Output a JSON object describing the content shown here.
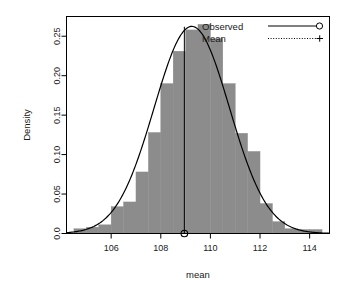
{
  "chart_data": {
    "type": "histogram",
    "title": "",
    "xlabel": "mean",
    "ylabel": "Density",
    "xlim": [
      104.2,
      114.8
    ],
    "ylim": [
      0.0,
      0.275
    ],
    "xticks": [
      106,
      108,
      110,
      112,
      114
    ],
    "xtick_labels": [
      "106",
      "108",
      "110",
      "112",
      "114"
    ],
    "yticks": [
      0.0,
      0.05,
      0.1,
      0.15,
      0.2,
      0.25
    ],
    "ytick_labels": [
      "0.0",
      "0.05",
      "0.10",
      "0.15",
      "0.20",
      "0.25"
    ],
    "grid": false,
    "bin_width": 0.5,
    "bar_color": "#8c8c8c",
    "bars": [
      {
        "x0": 104.5,
        "x1": 105.0,
        "density": 0.006
      },
      {
        "x0": 105.0,
        "x1": 105.5,
        "density": 0.008
      },
      {
        "x0": 105.5,
        "x1": 106.0,
        "density": 0.011
      },
      {
        "x0": 106.0,
        "x1": 106.5,
        "density": 0.034
      },
      {
        "x0": 106.5,
        "x1": 107.0,
        "density": 0.04
      },
      {
        "x0": 107.0,
        "x1": 107.5,
        "density": 0.078
      },
      {
        "x0": 107.5,
        "x1": 108.0,
        "density": 0.128
      },
      {
        "x0": 108.0,
        "x1": 108.5,
        "density": 0.19
      },
      {
        "x0": 108.5,
        "x1": 109.0,
        "density": 0.231
      },
      {
        "x0": 109.0,
        "x1": 109.5,
        "density": 0.258
      },
      {
        "x0": 109.5,
        "x1": 110.0,
        "density": 0.265
      },
      {
        "x0": 110.0,
        "x1": 110.5,
        "density": 0.247
      },
      {
        "x0": 110.5,
        "x1": 111.0,
        "density": 0.19
      },
      {
        "x0": 111.0,
        "x1": 111.5,
        "density": 0.127
      },
      {
        "x0": 111.5,
        "x1": 112.0,
        "density": 0.104
      },
      {
        "x0": 112.0,
        "x1": 112.5,
        "density": 0.038
      },
      {
        "x0": 112.5,
        "x1": 113.0,
        "density": 0.015
      },
      {
        "x0": 113.0,
        "x1": 113.5,
        "density": 0.006
      },
      {
        "x0": 113.5,
        "x1": 114.0,
        "density": 0.005
      },
      {
        "x0": 114.0,
        "x1": 114.5,
        "density": 0.005
      }
    ],
    "curve": {
      "name": "Observed",
      "type": "normal_density",
      "mean": 109.25,
      "sd": 1.52,
      "peak_density": 0.262,
      "color": "#000000"
    },
    "mean_marker": {
      "name": "Mean",
      "value": 108.95,
      "line_style": "solid",
      "point_y": 0.0,
      "color": "#000000"
    }
  },
  "legend": {
    "position": "top-right",
    "entries": [
      {
        "label": "Observed",
        "symbol": "circle",
        "line_style": "solid"
      },
      {
        "label": "Mean",
        "symbol": "plus",
        "line_style": "dotted"
      }
    ]
  }
}
